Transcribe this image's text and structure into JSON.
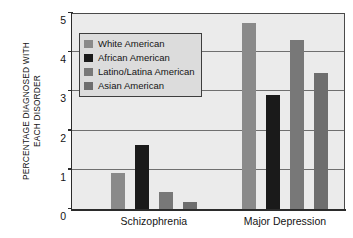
{
  "chart_data": {
    "type": "bar",
    "title": "",
    "subtitle": "",
    "xlabel": "",
    "ylabel": "PERCENTAGE DIAGNOSED WITH EACH DISORDER",
    "ylabel_line1": "PERCENTAGE DIAGNOSED WITH",
    "ylabel_line2": "EACH DISORDER",
    "categories": [
      "Schizophrenia",
      "Major Depression"
    ],
    "series": [
      {
        "name": "White American",
        "values": [
          0.92,
          4.75
        ],
        "color": "#8a8a8a"
      },
      {
        "name": "African American",
        "values": [
          1.63,
          2.92
        ],
        "color": "#1a1a1a"
      },
      {
        "name": "Latino/Latina American",
        "values": [
          0.43,
          4.3
        ],
        "color": "#787878"
      },
      {
        "name": "Asian American",
        "values": [
          0.19,
          3.48
        ],
        "color": "#6e6e6e"
      }
    ],
    "ylim": [
      0,
      5
    ],
    "ytick_labels": [
      "0",
      "1",
      "2",
      "3",
      "4",
      "5"
    ],
    "ytick_values": [
      0,
      1,
      2,
      3,
      4,
      5
    ],
    "gridline_values": [
      1,
      2,
      3,
      4
    ],
    "grid": true,
    "legend_position": "upper-left-inside",
    "plot_background": "#ebebeb",
    "axis_color": "#2b2b2b",
    "gridline_color": "#6f6f6f",
    "legend_background": "#dcdcdc",
    "legend_border": "#3d3d3d"
  }
}
